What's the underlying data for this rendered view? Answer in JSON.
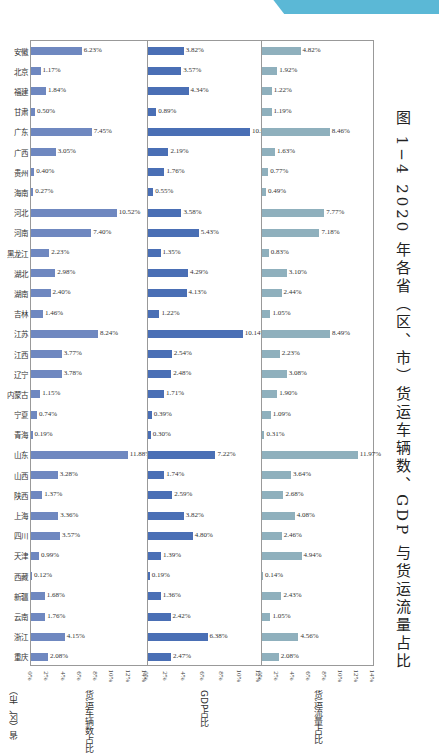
{
  "caption": "图 1−4  2020 年各省（区、市）货运车辆数、GDP 与货运流量占比",
  "ylabel": "省（区、市）",
  "chart_data": {
    "type": "bar",
    "orientation": "horizontal",
    "title": "图 1−4 2020 年各省（区、市）货运车辆数、GDP 与货运流量占比",
    "categories": [
      "安徽",
      "北京",
      "福建",
      "甘肃",
      "广东",
      "广西",
      "贵州",
      "海南",
      "河北",
      "河南",
      "黑龙江",
      "湖北",
      "湖南",
      "吉林",
      "江苏",
      "江西",
      "辽宁",
      "内蒙古",
      "宁夏",
      "青海",
      "山东",
      "山西",
      "陕西",
      "上海",
      "四川",
      "天津",
      "西藏",
      "新疆",
      "云南",
      "浙江",
      "重庆"
    ],
    "series": [
      {
        "name": "货运车辆数占比",
        "color": "#6f88c0",
        "xlabel": "货运车辆数占比",
        "xlim": [
          0,
          14
        ],
        "values": [
          6.23,
          1.17,
          1.84,
          0.5,
          7.45,
          3.05,
          0.4,
          0.27,
          10.52,
          7.4,
          2.23,
          2.98,
          2.4,
          1.46,
          8.24,
          3.77,
          3.78,
          1.15,
          0.74,
          0.19,
          11.88,
          3.28,
          1.37,
          3.36,
          3.57,
          0.99,
          0.12,
          1.68,
          1.76,
          4.15,
          2.08
        ]
      },
      {
        "name": "GDP占比",
        "color": "#4a6fb5",
        "xlabel": "GDP占比",
        "xlim": [
          0,
          12
        ],
        "values": [
          3.82,
          3.57,
          4.34,
          0.89,
          10.94,
          2.19,
          1.76,
          0.55,
          3.58,
          5.43,
          1.35,
          4.29,
          4.13,
          1.22,
          10.14,
          2.54,
          2.48,
          1.71,
          0.39,
          0.3,
          7.22,
          1.74,
          2.59,
          3.82,
          4.8,
          1.39,
          0.19,
          1.36,
          2.42,
          6.38,
          2.47
        ]
      },
      {
        "name": "货运流量占比",
        "color": "#8fb0bd",
        "xlabel": "货运流量占比",
        "xlim": [
          0,
          14
        ],
        "values": [
          4.82,
          1.92,
          1.22,
          1.19,
          8.46,
          1.63,
          0.77,
          0.49,
          7.77,
          7.18,
          0.83,
          3.1,
          2.44,
          1.05,
          8.49,
          2.23,
          3.08,
          1.9,
          1.09,
          0.31,
          11.97,
          3.64,
          2.68,
          4.08,
          2.46,
          4.94,
          0.14,
          2.43,
          1.05,
          4.56,
          2.08
        ]
      }
    ],
    "ticks": {
      "vehicles": [
        "0%",
        "2%",
        "4%",
        "6%",
        "8%",
        "10%",
        "12%",
        "14%"
      ],
      "gdp": [
        "0%",
        "2%",
        "4%",
        "6%",
        "8%",
        "10%",
        "12%"
      ],
      "freight": [
        "0%",
        "2%",
        "4%",
        "6%",
        "8%",
        "10%",
        "12%",
        "14%"
      ]
    },
    "grid": false,
    "legend": "none"
  }
}
